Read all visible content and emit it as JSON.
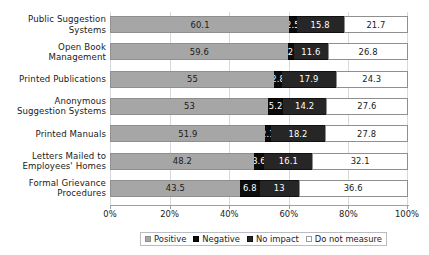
{
  "cropped_header_text": "",
  "chart_data": {
    "type": "bar",
    "orientation": "horizontal",
    "stacked": true,
    "stack_mode": "percent",
    "title": "",
    "subtitle": "",
    "xlabel": "",
    "ylabel": "",
    "xlim": [
      0,
      100
    ],
    "xticks": [
      "0%",
      "20%",
      "40%",
      "60%",
      "80%",
      "100%"
    ],
    "xtick_values": [
      0,
      20,
      40,
      60,
      80,
      100
    ],
    "grid": true,
    "grid_axis": "x",
    "legend_position": "bottom",
    "categories": [
      "Public Suggestion Systems",
      "Open Book Management",
      "Printed Publications",
      "Anonymous Suggestion Systems",
      "Printed Manuals",
      "Letters Mailed to Employees' Homes",
      "Formal Grievance Procedures"
    ],
    "series": [
      {
        "name": "Positive",
        "color": "#a6a6a6",
        "values": [
          60.1,
          59.6,
          55,
          53,
          51.9,
          48.2,
          43.5
        ],
        "labels": [
          "60.1",
          "59.6",
          "55",
          "53",
          "51.9",
          "48.2",
          "43.5"
        ]
      },
      {
        "name": "Negative",
        "color": "#0c0c0c",
        "values": [
          2.5,
          2,
          2.8,
          5.2,
          2.1,
          3.6,
          6.8
        ],
        "labels": [
          "2.5",
          "2",
          "2.8",
          "5.2",
          "2.1",
          "3.6",
          "6.8"
        ]
      },
      {
        "name": "No impact",
        "color": "#262626",
        "values": [
          15.8,
          11.6,
          17.9,
          14.2,
          18.2,
          16.1,
          13
        ],
        "labels": [
          "15.8",
          "11.6",
          "17.9",
          "14.2",
          "18.2",
          "16.1",
          "13"
        ]
      },
      {
        "name": "Do not measure",
        "color": "#ffffff",
        "values": [
          21.7,
          26.8,
          24.3,
          27.6,
          27.8,
          32.1,
          36.6
        ],
        "labels": [
          "21.7",
          "26.8",
          "24.3",
          "27.6",
          "27.8",
          "32.1",
          "36.6"
        ]
      }
    ]
  },
  "category_lines": [
    [
      "Public Suggestion",
      "Systems"
    ],
    [
      "Open Book",
      "Management"
    ],
    [
      "Printed Publications"
    ],
    [
      "Anonymous",
      "Suggestion Systems"
    ],
    [
      "Printed Manuals"
    ],
    [
      "Letters Mailed to",
      "Employees' Homes"
    ],
    [
      "Formal Grievance",
      "Procedures"
    ]
  ]
}
